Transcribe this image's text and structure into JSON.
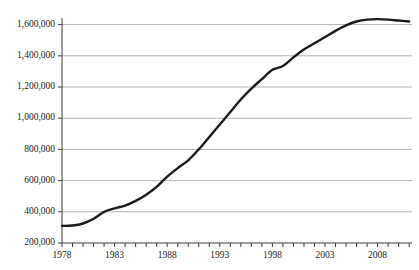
{
  "chart_data": {
    "type": "line",
    "title": "",
    "subtitle": "",
    "xlabel": "",
    "ylabel": "",
    "grid": "horizontal",
    "legend": "none",
    "xlim": [
      1978,
      2011
    ],
    "ylim": [
      200000,
      1700000
    ],
    "y_ticks": [
      200000,
      400000,
      600000,
      800000,
      1000000,
      1200000,
      1400000,
      1600000
    ],
    "y_tick_labels": [
      "200,000",
      "400,000",
      "600,000",
      "800,000",
      "1,000,000",
      "1,200,000",
      "1,400,000",
      "1,600,000"
    ],
    "x_ticks": [
      1978,
      1979,
      1980,
      1981,
      1982,
      1983,
      1984,
      1985,
      1986,
      1987,
      1988,
      1989,
      1990,
      1991,
      1992,
      1993,
      1994,
      1995,
      1996,
      1997,
      1998,
      1999,
      2000,
      2001,
      2002,
      2003,
      2004,
      2005,
      2006,
      2007,
      2008,
      2009,
      2010,
      2011
    ],
    "x_tick_labels": [
      "1978",
      "1983",
      "1988",
      "1993",
      "1998",
      "2003",
      "2008"
    ],
    "x_labeled_ticks": [
      1978,
      1983,
      1988,
      1993,
      1998,
      2003,
      2008
    ],
    "line_color": "#1a1a1a",
    "gridline_color": "#b4b4b4",
    "axis_color": "#3c3c3c",
    "series": [
      {
        "name": "",
        "x": [
          1978,
          1979,
          1980,
          1981,
          1982,
          1983,
          1984,
          1985,
          1986,
          1987,
          1988,
          1989,
          1990,
          1991,
          1992,
          1993,
          1994,
          1995,
          1996,
          1997,
          1998,
          1999,
          2000,
          2001,
          2002,
          2003,
          2004,
          2005,
          2006,
          2007,
          2008,
          2009,
          2010,
          2011
        ],
        "values": [
          310000,
          312000,
          325000,
          355000,
          400000,
          422000,
          440000,
          470000,
          510000,
          560000,
          625000,
          680000,
          730000,
          800000,
          880000,
          960000,
          1040000,
          1120000,
          1190000,
          1250000,
          1310000,
          1335000,
          1390000,
          1440000,
          1480000,
          1520000,
          1560000,
          1595000,
          1620000,
          1632000,
          1635000,
          1632000,
          1626000,
          1620000
        ]
      }
    ]
  }
}
